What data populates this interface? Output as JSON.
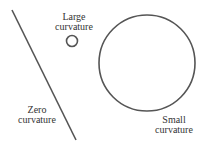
{
  "labels": {
    "large": [
      "Large",
      "curvature"
    ],
    "zero": [
      "Zero",
      "curvature"
    ],
    "small": [
      "Small",
      "curvature"
    ]
  },
  "colors": {
    "stroke": "#555555",
    "text": "#333333"
  }
}
